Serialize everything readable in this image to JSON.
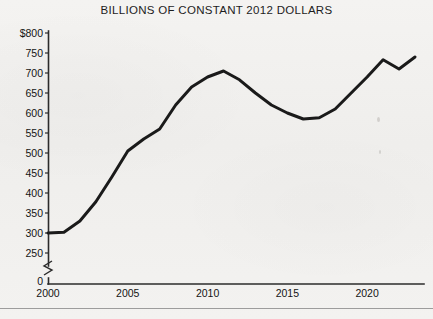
{
  "chart_data": {
    "type": "line",
    "title": "BILLIONS OF CONSTANT 2012 DOLLARS",
    "xlabel": "",
    "ylabel": "",
    "grid": false,
    "legend": null,
    "y_axis_break": true,
    "y_break_label": "0",
    "ylim": [
      250,
      800
    ],
    "yticks": [
      800,
      750,
      700,
      650,
      600,
      550,
      500,
      450,
      400,
      350,
      300,
      250
    ],
    "ytick_labels": [
      "$800",
      "750",
      "700",
      "650",
      "600",
      "550",
      "500",
      "450",
      "400",
      "350",
      "300",
      "250"
    ],
    "xlim": [
      2000,
      2023
    ],
    "xticks": [
      2000,
      2005,
      2010,
      2015,
      2020
    ],
    "xtick_labels": [
      "2000",
      "2005",
      "2010",
      "2015",
      "2020"
    ],
    "x": [
      2000,
      2001,
      2002,
      2003,
      2004,
      2005,
      2006,
      2007,
      2008,
      2009,
      2010,
      2011,
      2012,
      2013,
      2014,
      2015,
      2016,
      2017,
      2018,
      2019,
      2020,
      2021,
      2022,
      2023
    ],
    "values": [
      300,
      302,
      330,
      378,
      440,
      505,
      535,
      560,
      620,
      665,
      690,
      705,
      683,
      650,
      620,
      600,
      585,
      588,
      610,
      650,
      690,
      733,
      710,
      740
    ],
    "series_name": "Constant 2012 dollars",
    "line_color": "#1a1a1a",
    "background_color": "#f2f1ef"
  }
}
